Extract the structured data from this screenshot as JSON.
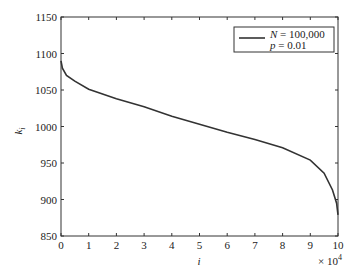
{
  "chart_data": {
    "type": "line",
    "title": "",
    "xlabel": "i",
    "ylabel": "k_i",
    "x_multiplier": "× 10^4",
    "xlim": [
      0,
      10
    ],
    "ylim": [
      850,
      1150
    ],
    "xticks": [
      0,
      1,
      2,
      3,
      4,
      5,
      6,
      7,
      8,
      9,
      10
    ],
    "yticks": [
      850,
      900,
      950,
      1000,
      1050,
      1100,
      1150
    ],
    "grid": false,
    "legend_position": "upper right",
    "series": [
      {
        "name": "N = 100,000, p = 0.01",
        "x": [
          0,
          0.05,
          0.2,
          0.5,
          1,
          2,
          3,
          4,
          5,
          6,
          7,
          8,
          9,
          9.5,
          9.8,
          9.95,
          10
        ],
        "values": [
          1090,
          1080,
          1070,
          1062,
          1051,
          1038,
          1027,
          1014,
          1003,
          992,
          982,
          971,
          954,
          936,
          913,
          895,
          879
        ]
      }
    ]
  },
  "axes": {
    "x_tick_labels": [
      "0",
      "1",
      "2",
      "3",
      "4",
      "5",
      "6",
      "7",
      "8",
      "9",
      "10"
    ],
    "y_tick_labels": [
      "850",
      "900",
      "950",
      "1000",
      "1050",
      "1100",
      "1150"
    ],
    "x_label": "i",
    "y_label_main": "k",
    "y_label_sub": "i",
    "x_multiplier_base": "× 10",
    "x_multiplier_exp": "4"
  },
  "legend": {
    "line1_var": "N",
    "line1_rest": " = 100,000",
    "line2_var": "p",
    "line2_rest": " = 0.01"
  }
}
